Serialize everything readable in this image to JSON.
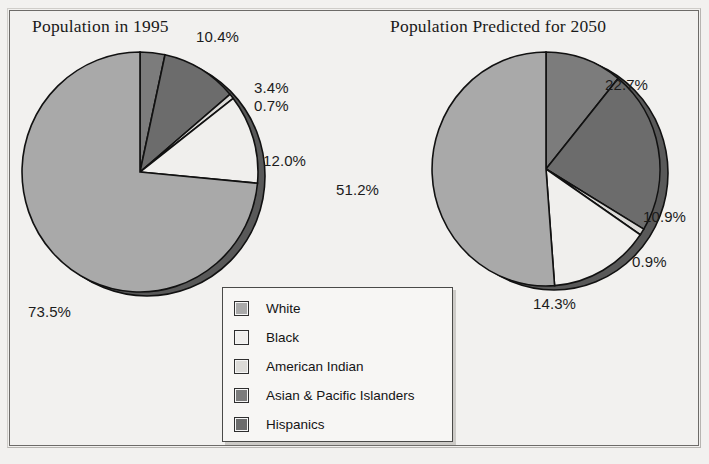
{
  "figure": {
    "background_color": "#f2f1ef",
    "frame_color": "#6d6b68"
  },
  "legend": {
    "name": "chart-legend",
    "items": [
      {
        "label": "White",
        "color": "#a9a9a9"
      },
      {
        "label": "Black",
        "color": "#f0efed"
      },
      {
        "label": "American Indian",
        "color": "#dcdbd8"
      },
      {
        "label": "Asian & Pacific Islanders",
        "color": "#7c7c7c"
      },
      {
        "label": "Hispanics",
        "color": "#6c6c6c"
      }
    ]
  },
  "chart_data": [
    {
      "type": "pie",
      "title": "Population in 1995",
      "categories": [
        "White",
        "Black",
        "American Indian",
        "Asian & Pacific Islanders",
        "Hispanics"
      ],
      "values": [
        73.5,
        12.0,
        0.7,
        3.4,
        10.4
      ],
      "value_labels": [
        "73.5%",
        "12.0%",
        "0.7%",
        "3.4%",
        "10.4%"
      ],
      "colors": [
        "#a9a9a9",
        "#f0efed",
        "#dcdbd8",
        "#7c7c7c",
        "#6c6c6c"
      ],
      "draw_order": [
        "Asian & Pacific Islanders",
        "Hispanics",
        "American Indian",
        "Black",
        "White"
      ],
      "start_angle_deg": 0,
      "direction": "clockwise",
      "legend_position": "bottom-center",
      "grid": false
    },
    {
      "type": "pie",
      "title": "Population Predicted for 2050",
      "categories": [
        "White",
        "Black",
        "American Indian",
        "Asian & Pacific Islanders",
        "Hispanics"
      ],
      "values": [
        51.2,
        14.3,
        0.9,
        10.9,
        22.7
      ],
      "value_labels": [
        "51.2%",
        "14.3%",
        "0.9%",
        "10.9%",
        "22.7%"
      ],
      "colors": [
        "#a9a9a9",
        "#f0efed",
        "#dcdbd8",
        "#7c7c7c",
        "#6c6c6c"
      ],
      "draw_order": [
        "Asian & Pacific Islanders",
        "Hispanics",
        "American Indian",
        "Black",
        "White"
      ],
      "start_angle_deg": 0,
      "direction": "clockwise",
      "legend_position": "bottom-center",
      "grid": false
    }
  ],
  "left_chart": {
    "title": "Population in 1995",
    "labels": {
      "asian": "10.4%",
      "hispanic": "3.4%",
      "american_indian": "0.7%",
      "black": "12.0%",
      "white": "73.5%"
    }
  },
  "right_chart": {
    "title": "Population Predicted for 2050",
    "labels": {
      "asian": "22.7%",
      "hispanic": "10.9%",
      "american_indian": "0.9%",
      "black": "14.3%",
      "white": "51.2%"
    }
  }
}
